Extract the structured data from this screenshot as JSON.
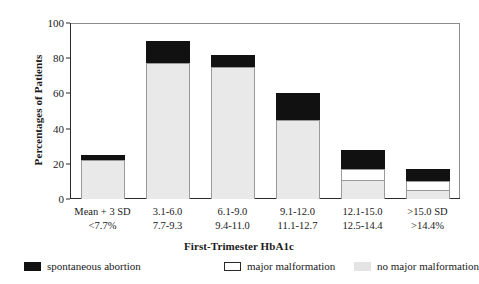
{
  "chart_data": {
    "type": "bar",
    "subtype": "stacked-bar",
    "title": "",
    "xlabel": "First-Trimester HbA1c",
    "ylabel": "Percentages of Patients",
    "ylim": [
      0,
      100
    ],
    "yticks": [
      0,
      20,
      40,
      60,
      80,
      100
    ],
    "grid": false,
    "legend_position": "below-axis",
    "categories": [
      "Mean + 3 SD\n<7.7%",
      "3.1-6.0\n7.7-9.3",
      "6.1-9.0\n9.4-11.0",
      "9.1-12.0\n11.1-12.7",
      "12.1-15.0\n12.5-14.4",
      ">15.0 SD\n>14.4%"
    ],
    "category_lines": [
      {
        "line1": "Mean + 3 SD",
        "line2": "<7.7%"
      },
      {
        "line1": "3.1-6.0",
        "line2": "7.7-9.3"
      },
      {
        "line1": "6.1-9.0",
        "line2": "9.4-11.0"
      },
      {
        "line1": "9.1-12.0",
        "line2": "11.1-12.7"
      },
      {
        "line1": "12.1-15.0",
        "line2": "12.5-14.4"
      },
      {
        "line1": ">15.0 SD",
        "line2": ">14.4%"
      }
    ],
    "series": [
      {
        "name": "no major malformation",
        "color": "#e9e9e9",
        "values": [
          22,
          77,
          75,
          45,
          11,
          5
        ]
      },
      {
        "name": "major malformation",
        "color": "#ffffff",
        "values": [
          0,
          0,
          0,
          0,
          6,
          5
        ]
      },
      {
        "name": "spontaneous abortion",
        "color": "#111111",
        "values": [
          3,
          13,
          7,
          15,
          11,
          7
        ]
      }
    ],
    "totals": [
      25,
      90,
      82,
      60,
      28,
      17
    ]
  },
  "axis": {
    "ylabel": "Percentages of Patients",
    "xlabel": "First-Trimester HbA1c",
    "ytick_labels": [
      "0",
      "20",
      "40",
      "60",
      "80",
      "100"
    ]
  },
  "legend": {
    "items": [
      {
        "label": "spontaneous abortion",
        "swatch": "black"
      },
      {
        "label": "major malformation",
        "swatch": "white"
      },
      {
        "label": "no major malformation",
        "swatch": "gray"
      }
    ]
  }
}
